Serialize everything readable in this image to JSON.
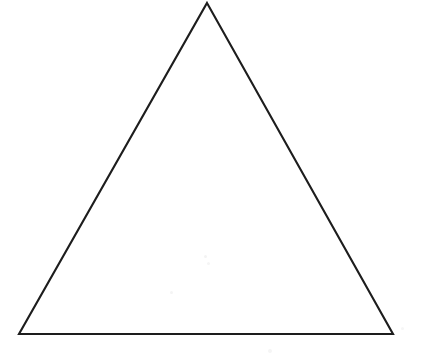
{
  "canvas": {
    "width": 422,
    "height": 359,
    "background_color": "#ffffff",
    "description": "Line drawing of a single hollow triangle"
  },
  "figure": {
    "name": "triangle",
    "shape_type": "triangle",
    "label": "",
    "fill_color": "#ffffff",
    "stroke_color": "#1d1d1d",
    "stroke_width": 2.1,
    "filled": false,
    "vertices": [
      {
        "name": "apex",
        "x": 207,
        "y": 3
      },
      {
        "name": "bottom-right",
        "x": 393,
        "y": 334
      },
      {
        "name": "bottom-left",
        "x": 19,
        "y": 334
      }
    ],
    "points_attr": "207,3 393,334 19,334",
    "base_width": 374,
    "height_px": 331,
    "classification": "isosceles"
  },
  "artifacts": {
    "specks": [
      {
        "x": 204,
        "y": 255,
        "size": 3,
        "color": "#f3f3f3"
      },
      {
        "x": 207,
        "y": 262,
        "size": 3,
        "color": "#f5f5f5"
      },
      {
        "x": 170,
        "y": 291,
        "size": 3,
        "color": "#f4f4f4"
      },
      {
        "x": 268,
        "y": 349,
        "size": 4,
        "color": "#f5f5f5"
      },
      {
        "x": 401,
        "y": 327,
        "size": 3,
        "color": "#f6f6f6"
      }
    ]
  }
}
